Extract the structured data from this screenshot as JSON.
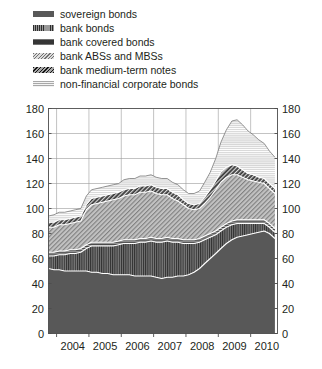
{
  "legend": {
    "items": [
      {
        "label": "sovereign bonds",
        "icon": "legend-swatch-solid-dark",
        "key": "sovereign"
      },
      {
        "label": "bank bonds",
        "icon": "legend-swatch-vertical-hatch",
        "key": "bank"
      },
      {
        "label": "bank covered bonds",
        "icon": "legend-swatch-horizontal-dark",
        "key": "covered"
      },
      {
        "label": "bank ABSs and MBSs",
        "icon": "legend-swatch-diagonal-light",
        "key": "abs"
      },
      {
        "label": "bank medium-term notes",
        "icon": "legend-swatch-diagonal-dark",
        "key": "mtn"
      },
      {
        "label": "non-financial corporate bonds",
        "icon": "legend-swatch-horizontal-light",
        "key": "corporate"
      }
    ]
  },
  "colors": {
    "sovereign": "#585858",
    "bank": "#6d6d6d",
    "covered": "#4a4a4a",
    "abs": "#b3b3b3",
    "mtn": "#4f4f4f",
    "corporate": "#cfcfcf",
    "grid": "#9b9b9b",
    "frame": "#4d4d4d",
    "text": "#231f20",
    "background": "#ffffff"
  },
  "chart_data": {
    "type": "area",
    "stacked": true,
    "title": "",
    "subtitle": "",
    "xlabel": "",
    "ylabel": "",
    "xlim": [
      2003.75,
      2010.83
    ],
    "ylim": [
      0,
      180
    ],
    "yticks": [
      0,
      20,
      40,
      60,
      80,
      100,
      120,
      140,
      160,
      180
    ],
    "ytick_labels": [
      "0",
      "20",
      "40",
      "60",
      "80",
      "100",
      "120",
      "140",
      "160",
      "180"
    ],
    "y_axis_left": true,
    "y_axis_right": true,
    "xticks": [
      2004,
      2005,
      2006,
      2007,
      2008,
      2009,
      2010
    ],
    "xtick_labels": [
      "2004",
      "2005",
      "2006",
      "2007",
      "2008",
      "2009",
      "2010"
    ],
    "grid": {
      "vertical": true,
      "horizontal": true
    },
    "legend_position": "above-plot",
    "x": [
      2003.75,
      2003.92,
      2004.08,
      2004.25,
      2004.42,
      2004.58,
      2004.75,
      2004.92,
      2005.08,
      2005.25,
      2005.42,
      2005.58,
      2005.75,
      2005.92,
      2006.08,
      2006.25,
      2006.42,
      2006.58,
      2006.75,
      2006.92,
      2007.08,
      2007.25,
      2007.42,
      2007.58,
      2007.75,
      2007.92,
      2008.08,
      2008.25,
      2008.42,
      2008.58,
      2008.75,
      2008.92,
      2009.08,
      2009.25,
      2009.42,
      2009.58,
      2009.75,
      2009.92,
      2010.08,
      2010.25,
      2010.42,
      2010.58,
      2010.75
    ],
    "series": [
      {
        "name": "sovereign bonds",
        "key": "sovereign",
        "values": [
          52,
          51,
          51,
          50,
          50,
          50,
          50,
          50,
          49,
          49,
          48,
          48,
          47,
          47,
          47,
          47,
          46,
          46,
          46,
          46,
          45,
          44,
          45,
          45,
          46,
          46,
          47,
          49,
          52,
          56,
          60,
          64,
          68,
          72,
          75,
          77,
          78,
          79,
          80,
          81,
          82,
          80,
          76
        ]
      },
      {
        "name": "bank bonds",
        "key": "bank",
        "values": [
          10,
          11,
          12,
          13,
          14,
          14,
          15,
          18,
          21,
          21,
          22,
          22,
          23,
          24,
          25,
          25,
          26,
          27,
          27,
          28,
          28,
          29,
          29,
          28,
          27,
          26,
          25,
          23,
          21,
          19,
          17,
          15,
          14,
          13,
          12,
          11,
          10,
          9,
          8,
          7,
          6,
          5,
          5
        ]
      },
      {
        "name": "bank covered bonds",
        "key": "covered",
        "values": [
          3,
          3,
          3,
          3,
          3,
          3,
          3,
          3,
          3,
          3,
          3,
          3,
          3,
          3,
          3,
          3,
          3,
          3,
          3,
          3,
          3,
          3,
          3,
          3,
          3,
          3,
          3,
          3,
          3,
          3,
          3,
          3,
          3,
          3,
          3,
          3,
          3,
          3,
          3,
          3,
          3,
          3,
          3
        ]
      },
      {
        "name": "bank ABSs and MBSs",
        "key": "abs",
        "values": [
          20,
          20,
          21,
          21,
          21,
          22,
          22,
          28,
          30,
          31,
          32,
          33,
          34,
          34,
          35,
          36,
          36,
          37,
          37,
          37,
          36,
          35,
          34,
          32,
          30,
          28,
          25,
          24,
          24,
          26,
          29,
          33,
          36,
          37,
          37,
          36,
          34,
          32,
          31,
          30,
          29,
          28,
          28
        ]
      },
      {
        "name": "bank medium-term notes",
        "key": "mtn",
        "values": [
          4,
          4,
          4,
          4,
          4,
          4,
          4,
          4,
          5,
          5,
          5,
          5,
          5,
          5,
          5,
          5,
          5,
          5,
          5,
          5,
          5,
          5,
          5,
          5,
          5,
          4,
          4,
          4,
          4,
          5,
          6,
          7,
          8,
          8,
          8,
          7,
          6,
          5,
          5,
          4,
          4,
          4,
          4
        ]
      },
      {
        "name": "non-financial corporate bonds",
        "key": "corporate",
        "values": [
          5,
          6,
          6,
          6,
          6,
          6,
          6,
          7,
          7,
          7,
          7,
          7,
          7,
          7,
          8,
          8,
          8,
          8,
          8,
          8,
          8,
          8,
          8,
          8,
          8,
          8,
          8,
          9,
          10,
          12,
          14,
          18,
          24,
          30,
          35,
          37,
          36,
          34,
          32,
          30,
          28,
          26,
          25
        ]
      }
    ],
    "totals": [
      94,
      95,
      97,
      97,
      98,
      99,
      100,
      110,
      115,
      116,
      117,
      118,
      119,
      120,
      123,
      124,
      124,
      126,
      126,
      127,
      125,
      124,
      124,
      121,
      119,
      115,
      112,
      112,
      114,
      121,
      129,
      140,
      153,
      163,
      170,
      171,
      167,
      162,
      159,
      155,
      152,
      146,
      141
    ]
  }
}
